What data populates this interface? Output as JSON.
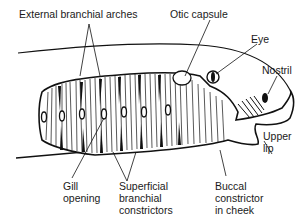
{
  "diagram": {
    "colors": {
      "ink": "#111111",
      "background": "#ffffff",
      "text": "#1a1a1a"
    },
    "labels": {
      "external_branchial_arches": "External branchial arches",
      "otic_capsule": "Otic capsule",
      "eye": "Eye",
      "nostril": "Nostril",
      "upper_lip_1": "Upper",
      "upper_lip_2": "lip",
      "gill_opening_1": "Gill",
      "gill_opening_2": "opening",
      "superficial_1": "Superficial",
      "superficial_2": "branchial",
      "superficial_3": "constrictors",
      "buccal_1": "Buccal",
      "buccal_2": "constrictor",
      "buccal_3": "in cheek"
    },
    "gill_openings_count": 7
  }
}
